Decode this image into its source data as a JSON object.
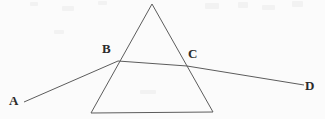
{
  "figure": {
    "name": "light-ray-through-prism-diagram",
    "background_color": "#fbfbfb",
    "stroke_color": "#5c5c5c",
    "label_color": "#2b2b2b",
    "width": 325,
    "height": 119,
    "labels": {
      "A": "A",
      "B": "B",
      "C": "C",
      "D": "D"
    },
    "shapes": {
      "triangle": {
        "type": "triangle",
        "apex": [
          152,
          4
        ],
        "bottom_left": [
          91,
          113
        ],
        "bottom_right": [
          213,
          112
        ]
      },
      "ray_incident": {
        "type": "line-segment",
        "from": [
          24,
          102
        ],
        "to": [
          118,
          61
        ],
        "endpoint_label": "A"
      },
      "ray_internal": {
        "type": "line-segment",
        "from": [
          118,
          61
        ],
        "to": [
          187,
          66
        ],
        "start_label": "B",
        "end_label": "C"
      },
      "ray_emergent": {
        "type": "line-segment",
        "from": [
          187,
          66
        ],
        "to": [
          304,
          85
        ],
        "endpoint_label": "D"
      }
    },
    "points": [
      {
        "label": "A",
        "x": 24,
        "y": 102,
        "role": "incident-ray-start"
      },
      {
        "label": "B",
        "x": 118,
        "y": 61,
        "role": "entry-point-on-left-face"
      },
      {
        "label": "C",
        "x": 187,
        "y": 66,
        "role": "exit-point-on-right-face"
      },
      {
        "label": "D",
        "x": 304,
        "y": 85,
        "role": "emergent-ray-end"
      }
    ],
    "specks": [
      {
        "x": 30,
        "y": 2,
        "w": 8,
        "h": 4
      },
      {
        "x": 62,
        "y": 6,
        "w": 12,
        "h": 5
      },
      {
        "x": 98,
        "y": 1,
        "w": 9,
        "h": 4
      },
      {
        "x": 205,
        "y": 3,
        "w": 14,
        "h": 6
      },
      {
        "x": 238,
        "y": 2,
        "w": 10,
        "h": 6
      },
      {
        "x": 262,
        "y": 5,
        "w": 13,
        "h": 5
      },
      {
        "x": 292,
        "y": 1,
        "w": 11,
        "h": 6
      },
      {
        "x": 140,
        "y": 90,
        "w": 16,
        "h": 4
      },
      {
        "x": 54,
        "y": 30,
        "w": 10,
        "h": 4
      }
    ]
  }
}
